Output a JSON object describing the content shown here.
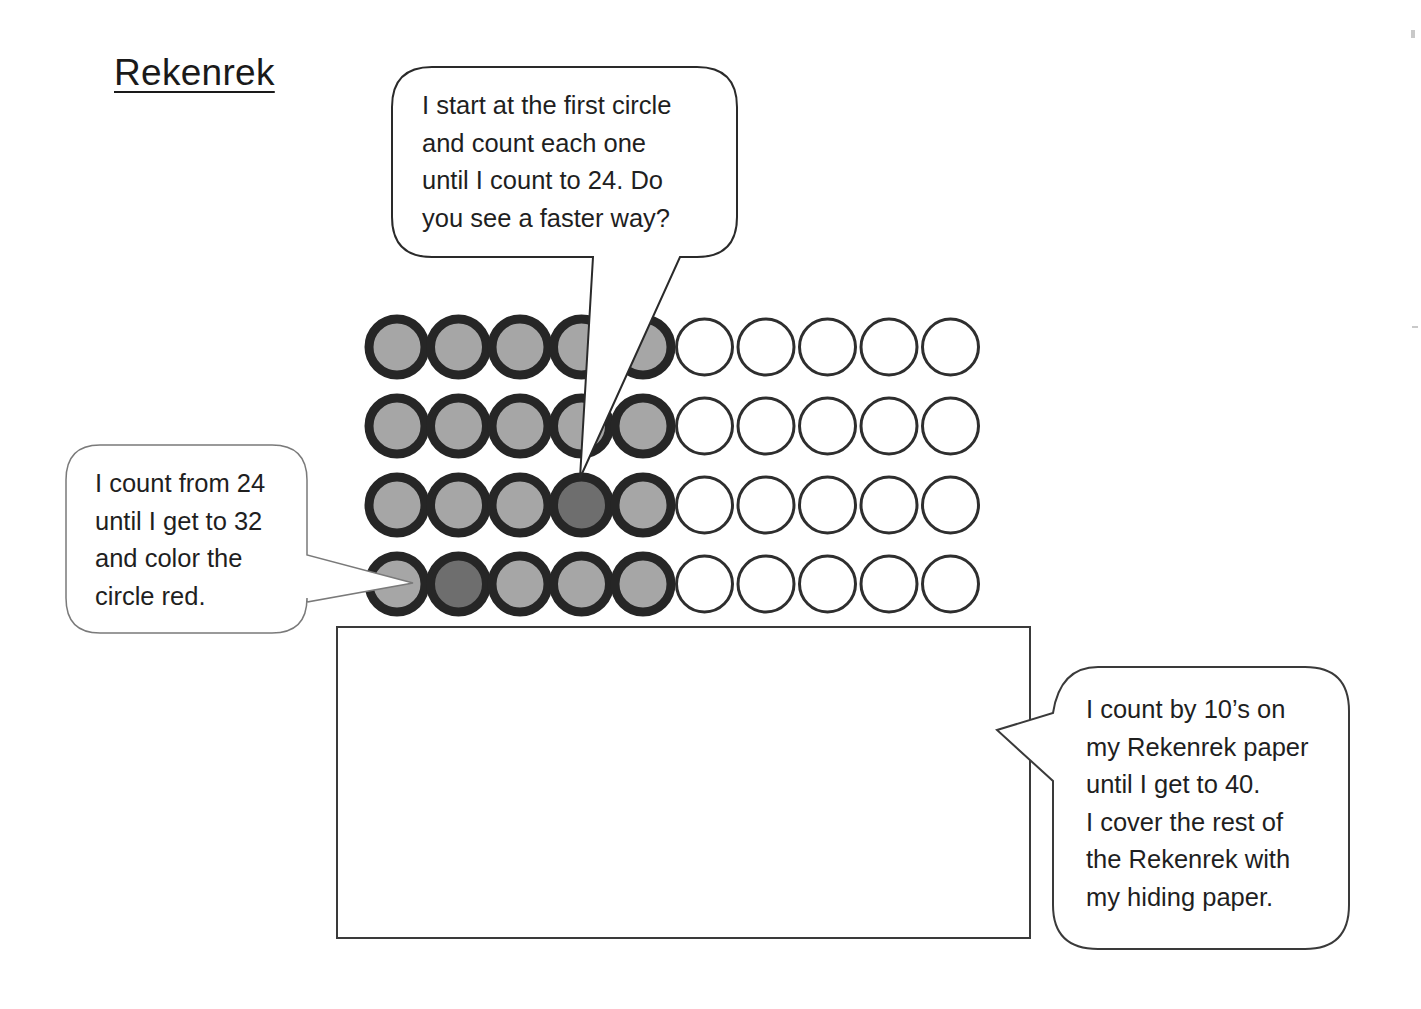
{
  "document": {
    "title": "Rekenrek"
  },
  "speech_bubbles": [
    {
      "id": "top",
      "text": "I start at the first circle\nand count each one\nuntil I count to 24.  Do\nyou see a faster way?"
    },
    {
      "id": "left",
      "text": "I count from 24\nuntil I get to 32\nand color the\ncircle red."
    },
    {
      "id": "right",
      "text": "I count by 10’s on\nmy Rekenrek paper\nuntil I get to 40.\nI cover the rest of\nthe Rekenrek with\nmy hiding paper."
    }
  ],
  "rekenrek": {
    "rows": 4,
    "columns": 10,
    "shaded_per_row": 5,
    "colors": {
      "shaded_fill": "#a6a6a6",
      "shaded_ring": "#262626",
      "marked_fill": "#6e6e6e",
      "empty_ring": "#2e2e2e",
      "empty_fill": "#ffffff"
    },
    "marked_beads": [
      {
        "row": 3,
        "col": 4
      },
      {
        "row": 4,
        "col": 2
      }
    ]
  },
  "hiding_paper": {
    "label": ""
  }
}
